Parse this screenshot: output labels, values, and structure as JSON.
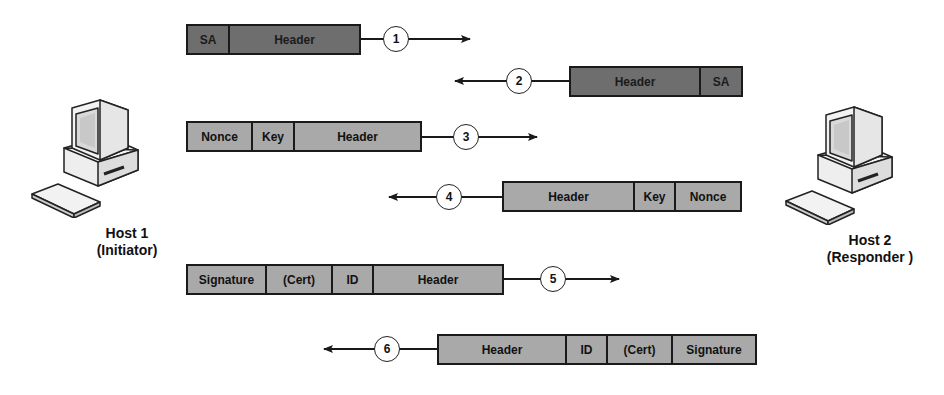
{
  "diagram": {
    "type": "sequence",
    "colors": {
      "dark_box": "#6e6e6e",
      "light_box": "#a9a9a9",
      "line": "#1a1a1a"
    },
    "hosts": [
      {
        "name": "Host 1",
        "role": "(Initiator)",
        "icon": "computer-icon"
      },
      {
        "name": "Host 2",
        "role": "(Responder )",
        "icon": "computer-icon"
      }
    ],
    "messages": [
      {
        "step": "1",
        "direction": "right",
        "fields": [
          "SA",
          "Header"
        ]
      },
      {
        "step": "2",
        "direction": "left",
        "fields": [
          "Header",
          "SA"
        ]
      },
      {
        "step": "3",
        "direction": "right",
        "fields": [
          "Nonce",
          "Key",
          "Header"
        ]
      },
      {
        "step": "4",
        "direction": "left",
        "fields": [
          "Header",
          "Key",
          "Nonce"
        ]
      },
      {
        "step": "5",
        "direction": "right",
        "fields": [
          "Signature",
          "(Cert)",
          "ID",
          "Header"
        ]
      },
      {
        "step": "6",
        "direction": "left",
        "fields": [
          "Header",
          "ID",
          "(Cert)",
          "Signature"
        ]
      }
    ]
  }
}
